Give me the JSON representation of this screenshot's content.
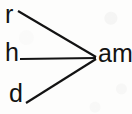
{
  "diagram": {
    "type": "word-family-fan",
    "ink_color": "#131313",
    "paper_color": "#fdfdfc",
    "stroke_width": 2,
    "onsets": [
      {
        "id": "r",
        "label": "r",
        "word": "ram",
        "position": "top-left"
      },
      {
        "id": "h",
        "label": "h",
        "word": "ham",
        "position": "middle-left"
      },
      {
        "id": "d",
        "label": "d",
        "word": "dam",
        "position": "bottom-left"
      }
    ],
    "rime": {
      "id": "am",
      "label": "am",
      "position": "right-center"
    },
    "connectors": [
      {
        "from": "r",
        "to": "am",
        "x1": 18,
        "y1": 11,
        "x2": 96,
        "y2": 57
      },
      {
        "from": "h",
        "to": "am",
        "x1": 20,
        "y1": 59,
        "x2": 96,
        "y2": 58
      },
      {
        "from": "d",
        "to": "am",
        "x1": 26,
        "y1": 103,
        "x2": 96,
        "y2": 59
      }
    ]
  }
}
